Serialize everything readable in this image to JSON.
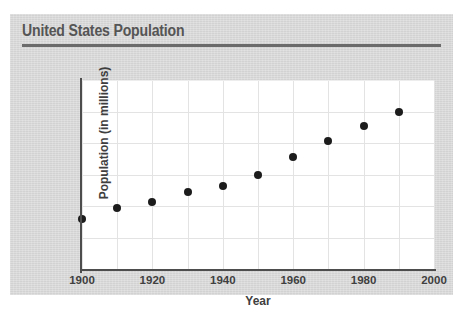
{
  "card": {
    "background_color": "#d9d9d9"
  },
  "header": {
    "title": "United States Population",
    "rule_color": "#6b6b6b",
    "title_color": "#555555"
  },
  "chart_data": {
    "type": "scatter",
    "title": "United States Population",
    "xlabel": "Year",
    "ylabel": "Population (in millions)",
    "xlim": [
      1900,
      2000
    ],
    "ylim": [
      0,
      300
    ],
    "x_ticks": [
      1900,
      1920,
      1940,
      1960,
      1980,
      2000
    ],
    "x_tick_labels": [
      "1900",
      "1920",
      "1940",
      "1960",
      "1980",
      "2000"
    ],
    "x_gridlines": [
      1900,
      1910,
      1920,
      1930,
      1940,
      1950,
      1960,
      1970,
      1980,
      1990,
      2000
    ],
    "y_ticks": [
      0,
      50,
      100,
      150,
      200,
      250,
      300
    ],
    "y_tick_labels": [
      "0",
      "50",
      "100",
      "150",
      "200",
      "250",
      "300"
    ],
    "grid": true,
    "legend": null,
    "marker_color": "#1c1c1c",
    "plot_background": "#ffffff",
    "gridline_color": "#e3e3e3",
    "axis_color": "#4d4d4d",
    "x": [
      1900,
      1910,
      1920,
      1930,
      1940,
      1950,
      1960,
      1970,
      1980,
      1990
    ],
    "values": [
      79,
      97,
      106,
      122,
      131,
      150,
      177,
      203,
      227,
      249
    ],
    "points": [
      {
        "year": 1900,
        "population": 79
      },
      {
        "year": 1910,
        "population": 97
      },
      {
        "year": 1920,
        "population": 106
      },
      {
        "year": 1930,
        "population": 122
      },
      {
        "year": 1940,
        "population": 131
      },
      {
        "year": 1950,
        "population": 150
      },
      {
        "year": 1960,
        "population": 177
      },
      {
        "year": 1970,
        "population": 203
      },
      {
        "year": 1980,
        "population": 227
      },
      {
        "year": 1990,
        "population": 249
      }
    ]
  }
}
